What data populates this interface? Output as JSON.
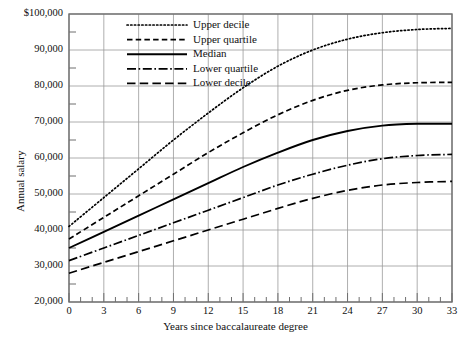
{
  "chart_data": {
    "type": "line",
    "title": "",
    "xlabel": "Years since baccalaureate degree",
    "ylabel": "Annual salary",
    "xlim": [
      0,
      33
    ],
    "ylim": [
      20000,
      100000
    ],
    "grid": true,
    "legend_position": "top-center",
    "x_major_step": 3,
    "x_minor_step": 1,
    "y_major_step": 10000,
    "y_minor_step": 5000,
    "xticklabels": [
      "0",
      "3",
      "6",
      "9",
      "12",
      "15",
      "18",
      "21",
      "24",
      "27",
      "30",
      "33"
    ],
    "yticklabels": [
      "20,000",
      "30,000",
      "40,000",
      "50,000",
      "60,000",
      "70,000",
      "80,000",
      "90,000",
      "$100,000"
    ],
    "x": [
      0,
      3,
      6,
      9,
      12,
      15,
      18,
      21,
      24,
      27,
      30,
      33
    ],
    "series": [
      {
        "name": "Upper decile",
        "style": "dotted",
        "color": "#000000",
        "values": [
          41000,
          49000,
          57000,
          65000,
          72500,
          79500,
          85500,
          90000,
          93000,
          94800,
          95700,
          96000
        ]
      },
      {
        "name": "Upper quartile",
        "style": "dashed",
        "color": "#000000",
        "values": [
          37500,
          43500,
          49500,
          55500,
          61500,
          67000,
          72000,
          76000,
          78800,
          80300,
          80900,
          81000
        ]
      },
      {
        "name": "Median",
        "style": "solid",
        "color": "#000000",
        "values": [
          35000,
          39500,
          44000,
          48500,
          53000,
          57500,
          61500,
          65000,
          67500,
          69000,
          69500,
          69500
        ]
      },
      {
        "name": "Lower quartile",
        "style": "dashdot",
        "color": "#000000",
        "values": [
          31500,
          35000,
          38500,
          42000,
          45500,
          49000,
          52500,
          55500,
          58000,
          59800,
          60700,
          61000
        ]
      },
      {
        "name": "Lower decile",
        "style": "longdash",
        "color": "#000000",
        "values": [
          28000,
          31000,
          34000,
          37000,
          40000,
          43000,
          46000,
          48800,
          51000,
          52500,
          53200,
          53500
        ]
      }
    ]
  },
  "legend": {
    "items": [
      {
        "label": "Upper decile"
      },
      {
        "label": "Upper quartile"
      },
      {
        "label": "Median"
      },
      {
        "label": "Lower quartile"
      },
      {
        "label": "Lower decile"
      }
    ]
  },
  "colors": {
    "ink": "#000000",
    "grid": "#9a9a9a",
    "axis": "#6f6f6f",
    "background": "#ffffff"
  }
}
